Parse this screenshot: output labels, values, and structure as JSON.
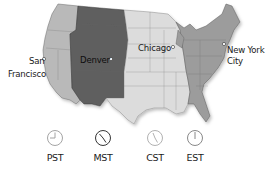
{
  "map": {
    "title": "US Time Zones",
    "zones": [
      {
        "id": "pacific",
        "label": "PST",
        "color": "#b9b9b9"
      },
      {
        "id": "mountain",
        "label": "MST",
        "color": "#5e5e5e"
      },
      {
        "id": "central",
        "label": "CST",
        "color": "#dcdcdc"
      },
      {
        "id": "eastern",
        "label": "EST",
        "color": "#9c9c9c"
      }
    ],
    "cities": [
      {
        "name_line1": "San",
        "name_line2": "Francisco",
        "zone": "pacific"
      },
      {
        "name_line1": "Denver",
        "zone": "mountain"
      },
      {
        "name_line1": "Chicago",
        "zone": "central"
      },
      {
        "name_line1": "New York",
        "name_line2": "City",
        "zone": "eastern"
      }
    ]
  },
  "clocks": [
    {
      "label": "PST",
      "hour_deg": 0,
      "minute_deg": 270,
      "stroke": "#9a9a9a"
    },
    {
      "label": "MST",
      "hour_deg": 300,
      "minute_deg": 150,
      "stroke": "#1e1e1e"
    },
    {
      "label": "CST",
      "hour_deg": 330,
      "minute_deg": 150,
      "stroke": "#a8a8a8"
    },
    {
      "label": "EST",
      "hour_deg": 0,
      "minute_deg": 180,
      "stroke": "#7a7a7a"
    }
  ]
}
